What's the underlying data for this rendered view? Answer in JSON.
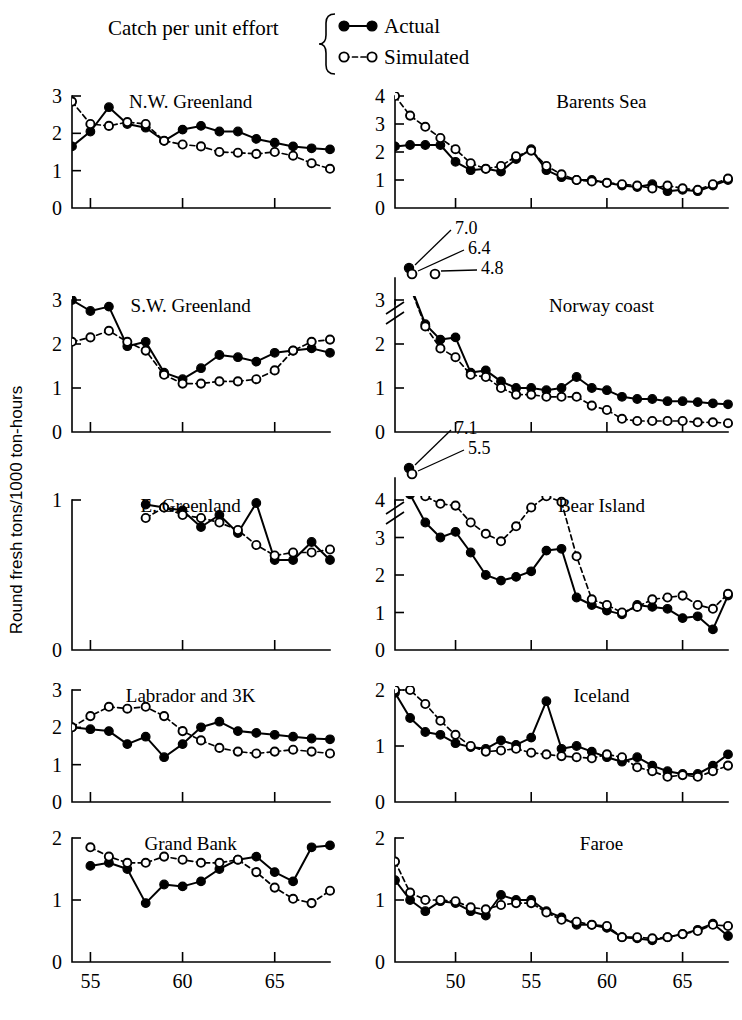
{
  "figure": {
    "ylabel": "Round fresh tons/1000 ton-hours",
    "legend_caption": "Catch per unit effort",
    "legend": [
      {
        "key": "actual",
        "label": "Actual"
      },
      {
        "key": "simulated",
        "label": "Simulated"
      }
    ]
  },
  "chart_data": {
    "type": "line",
    "title": "Catch per unit effort",
    "xlabel": "",
    "ylabel": "Round fresh tons/1000 ton-hours",
    "grid": false,
    "legend_position": "top-center",
    "series_styles": {
      "actual": {
        "marker": "filled-circle",
        "line": "solid"
      },
      "simulated": {
        "marker": "open-circle",
        "line": "dashed"
      }
    },
    "panels": [
      {
        "name": "N.W. Greenland",
        "column": "left",
        "xlim": [
          1954,
          1968
        ],
        "xticks": [
          55,
          60,
          65
        ],
        "ylim": [
          0,
          3
        ],
        "yticks": [
          0,
          1,
          2,
          3
        ],
        "axis_break": false,
        "offscale": [],
        "x": [
          1954,
          1955,
          1956,
          1957,
          1958,
          1959,
          1960,
          1961,
          1962,
          1963,
          1964,
          1965,
          1966,
          1967,
          1968
        ],
        "series": [
          {
            "name": "Actual",
            "key": "actual",
            "values": [
              1.65,
              2.05,
              2.7,
              2.25,
              2.15,
              1.8,
              2.1,
              2.2,
              2.05,
              2.05,
              1.85,
              1.75,
              1.65,
              1.6,
              1.57
            ]
          },
          {
            "name": "Simulated",
            "key": "simulated",
            "values": [
              2.85,
              2.25,
              2.2,
              2.3,
              2.25,
              1.8,
              1.7,
              1.65,
              1.5,
              1.48,
              1.45,
              1.5,
              1.4,
              1.2,
              1.05
            ]
          }
        ]
      },
      {
        "name": "Barents Sea",
        "column": "right",
        "xlim": [
          1946,
          1968
        ],
        "xticks": [
          50,
          55,
          60,
          65
        ],
        "ylim": [
          0,
          4
        ],
        "yticks": [
          0,
          1,
          2,
          3,
          4
        ],
        "axis_break": false,
        "offscale": [],
        "x": [
          1946,
          1947,
          1948,
          1949,
          1950,
          1951,
          1952,
          1953,
          1954,
          1955,
          1956,
          1957,
          1958,
          1959,
          1960,
          1961,
          1962,
          1963,
          1964,
          1965,
          1966,
          1967,
          1968
        ],
        "series": [
          {
            "name": "Actual",
            "key": "actual",
            "values": [
              2.2,
              2.25,
              2.25,
              2.25,
              1.65,
              1.35,
              1.4,
              1.3,
              1.75,
              2.1,
              1.35,
              1.1,
              1.0,
              1.0,
              0.9,
              0.8,
              0.75,
              0.85,
              0.6,
              0.65,
              0.6,
              0.8,
              1.0
            ]
          },
          {
            "name": "Simulated",
            "key": "simulated",
            "values": [
              4.0,
              3.3,
              2.9,
              2.5,
              2.1,
              1.6,
              1.4,
              1.5,
              1.85,
              2.05,
              1.5,
              1.2,
              1.0,
              0.95,
              0.9,
              0.85,
              0.8,
              0.7,
              0.8,
              0.7,
              0.65,
              0.85,
              1.05
            ]
          }
        ]
      },
      {
        "name": "S.W. Greenland",
        "column": "left",
        "xlim": [
          1954,
          1968
        ],
        "xticks": [
          55,
          60,
          65
        ],
        "ylim": [
          0,
          3
        ],
        "yticks": [
          0,
          1,
          2,
          3
        ],
        "axis_break": false,
        "offscale": [],
        "x": [
          1954,
          1955,
          1956,
          1957,
          1958,
          1959,
          1960,
          1961,
          1962,
          1963,
          1964,
          1965,
          1966,
          1967,
          1968
        ],
        "series": [
          {
            "name": "Actual",
            "key": "actual",
            "values": [
              3.0,
              2.75,
              2.85,
              1.95,
              2.05,
              1.35,
              1.2,
              1.45,
              1.75,
              1.7,
              1.6,
              1.8,
              1.85,
              1.9,
              1.8
            ]
          },
          {
            "name": "Simulated",
            "key": "simulated",
            "values": [
              2.05,
              2.15,
              2.3,
              2.05,
              1.85,
              1.3,
              1.1,
              1.1,
              1.15,
              1.15,
              1.2,
              1.4,
              1.85,
              2.05,
              2.1
            ]
          }
        ]
      },
      {
        "name": "Norway coast",
        "column": "right",
        "xlim": [
          1946,
          1968
        ],
        "xticks": [
          50,
          55,
          60,
          65
        ],
        "ylim": [
          0,
          3
        ],
        "yticks": [
          0,
          1,
          2,
          3
        ],
        "axis_break": true,
        "offscale": [
          {
            "label": "7.0",
            "series": "actual"
          },
          {
            "label": "6.4",
            "series": "simulated"
          },
          {
            "label": "4.8",
            "series": "simulated"
          }
        ],
        "x": [
          1947,
          1948,
          1949,
          1950,
          1951,
          1952,
          1953,
          1954,
          1955,
          1956,
          1957,
          1958,
          1959,
          1960,
          1961,
          1962,
          1963,
          1964,
          1965,
          1966,
          1967,
          1968
        ],
        "series": [
          {
            "name": "Actual",
            "key": "actual",
            "values": [
              3.35,
              2.45,
              2.1,
              2.15,
              1.35,
              1.4,
              1.15,
              1.0,
              1.0,
              0.95,
              1.0,
              1.25,
              1.0,
              0.95,
              0.8,
              0.75,
              0.75,
              0.7,
              0.7,
              0.68,
              0.65,
              0.63
            ]
          },
          {
            "name": "Simulated",
            "key": "simulated",
            "values": [
              3.3,
              2.4,
              1.9,
              1.7,
              1.3,
              1.25,
              1.0,
              0.85,
              0.85,
              0.8,
              0.8,
              0.8,
              0.6,
              0.5,
              0.3,
              0.25,
              0.25,
              0.25,
              0.25,
              0.22,
              0.22,
              0.2
            ]
          }
        ]
      },
      {
        "name": "E. Greenland",
        "column": "left",
        "xlim": [
          1954,
          1968
        ],
        "xticks": [
          55,
          60,
          65
        ],
        "ylim": [
          0,
          1
        ],
        "yticks": [
          0,
          1
        ],
        "axis_break": false,
        "offscale": [],
        "x": [
          1958,
          1959,
          1960,
          1961,
          1962,
          1963,
          1964,
          1965,
          1966,
          1967,
          1968
        ],
        "series": [
          {
            "name": "Actual",
            "key": "actual",
            "values": [
              0.97,
              0.95,
              0.93,
              0.82,
              0.9,
              0.78,
              0.98,
              0.6,
              0.6,
              0.72,
              0.6
            ]
          },
          {
            "name": "Simulated",
            "key": "simulated",
            "values": [
              0.88,
              0.95,
              0.9,
              0.88,
              0.85,
              0.8,
              0.7,
              0.63,
              0.65,
              0.65,
              0.67
            ]
          }
        ]
      },
      {
        "name": "Bear Island",
        "column": "right",
        "xlim": [
          1946,
          1968
        ],
        "xticks": [
          50,
          55,
          60,
          65
        ],
        "ylim": [
          0,
          4
        ],
        "yticks": [
          0,
          1,
          2,
          3,
          4
        ],
        "axis_break": true,
        "offscale": [
          {
            "label": "7.1",
            "series": "actual"
          },
          {
            "label": "5.5",
            "series": "simulated"
          }
        ],
        "x": [
          1947,
          1948,
          1949,
          1950,
          1951,
          1952,
          1953,
          1954,
          1955,
          1956,
          1957,
          1958,
          1959,
          1960,
          1961,
          1962,
          1963,
          1964,
          1965,
          1966,
          1967,
          1968
        ],
        "series": [
          {
            "name": "Actual",
            "key": "actual",
            "values": [
              4.15,
              3.4,
              3.0,
              3.15,
              2.6,
              2.0,
              1.85,
              1.95,
              2.1,
              2.65,
              2.7,
              1.4,
              1.2,
              1.05,
              0.95,
              1.2,
              1.15,
              1.1,
              0.85,
              0.9,
              0.55,
              1.45
            ]
          },
          {
            "name": "Simulated",
            "key": "simulated",
            "values": [
              4.2,
              4.1,
              3.9,
              3.85,
              3.4,
              3.1,
              2.9,
              3.3,
              3.8,
              4.1,
              3.95,
              2.5,
              1.35,
              1.2,
              1.0,
              1.15,
              1.35,
              1.4,
              1.45,
              1.2,
              1.1,
              1.5
            ]
          }
        ]
      },
      {
        "name": "Labrador and 3K",
        "column": "left",
        "xlim": [
          1954,
          1968
        ],
        "xticks": [
          55,
          60,
          65
        ],
        "ylim": [
          0,
          3
        ],
        "yticks": [
          0,
          1,
          2,
          3
        ],
        "axis_break": false,
        "offscale": [],
        "x": [
          1954,
          1955,
          1956,
          1957,
          1958,
          1959,
          1960,
          1961,
          1962,
          1963,
          1964,
          1965,
          1966,
          1967,
          1968
        ],
        "series": [
          {
            "name": "Actual",
            "key": "actual",
            "values": [
              2.0,
              1.95,
              1.9,
              1.55,
              1.75,
              1.2,
              1.55,
              2.0,
              2.15,
              1.9,
              1.85,
              1.8,
              1.75,
              1.7,
              1.68
            ]
          },
          {
            "name": "Simulated",
            "key": "simulated",
            "values": [
              2.0,
              2.3,
              2.55,
              2.5,
              2.55,
              2.3,
              1.9,
              1.65,
              1.45,
              1.35,
              1.3,
              1.35,
              1.4,
              1.35,
              1.3
            ]
          }
        ]
      },
      {
        "name": "Iceland",
        "column": "right",
        "xlim": [
          1946,
          1968
        ],
        "xticks": [
          50,
          55,
          60,
          65
        ],
        "ylim": [
          0,
          2
        ],
        "yticks": [
          0,
          1,
          2
        ],
        "axis_break": false,
        "offscale": [],
        "x": [
          1946,
          1947,
          1948,
          1949,
          1950,
          1951,
          1952,
          1953,
          1954,
          1955,
          1956,
          1957,
          1958,
          1959,
          1960,
          1961,
          1962,
          1963,
          1964,
          1965,
          1966,
          1967,
          1968
        ],
        "series": [
          {
            "name": "Actual",
            "key": "actual",
            "values": [
              1.95,
              1.5,
              1.25,
              1.2,
              1.05,
              0.98,
              0.95,
              1.1,
              1.02,
              1.15,
              1.8,
              0.95,
              1.0,
              0.9,
              0.8,
              0.72,
              0.8,
              0.65,
              0.55,
              0.5,
              0.5,
              0.65,
              0.85
            ]
          },
          {
            "name": "Simulated",
            "key": "simulated",
            "values": [
              2.0,
              2.0,
              1.75,
              1.45,
              1.2,
              1.0,
              0.9,
              0.92,
              0.95,
              0.88,
              0.85,
              0.82,
              0.8,
              0.78,
              0.85,
              0.8,
              0.62,
              0.55,
              0.45,
              0.48,
              0.45,
              0.55,
              0.65
            ]
          }
        ]
      },
      {
        "name": "Grand Bank",
        "column": "left",
        "xlim": [
          1954,
          1968
        ],
        "xticks": [
          55,
          60,
          65
        ],
        "ylim": [
          0,
          2
        ],
        "yticks": [
          0,
          1,
          2
        ],
        "axis_break": false,
        "offscale": [],
        "x": [
          1955,
          1956,
          1957,
          1958,
          1959,
          1960,
          1961,
          1962,
          1963,
          1964,
          1965,
          1966,
          1967,
          1968
        ],
        "series": [
          {
            "name": "Actual",
            "key": "actual",
            "values": [
              1.55,
              1.6,
              1.5,
              0.95,
              1.25,
              1.22,
              1.3,
              1.5,
              1.65,
              1.7,
              1.45,
              1.3,
              1.85,
              1.88
            ]
          },
          {
            "name": "Simulated",
            "key": "simulated",
            "values": [
              1.85,
              1.7,
              1.6,
              1.6,
              1.7,
              1.65,
              1.6,
              1.6,
              1.65,
              1.45,
              1.2,
              1.02,
              0.95,
              1.15
            ]
          }
        ]
      },
      {
        "name": "Faroe",
        "column": "right",
        "xlim": [
          1946,
          1968
        ],
        "xticks": [
          50,
          55,
          60,
          65
        ],
        "ylim": [
          0,
          2
        ],
        "yticks": [
          0,
          1,
          2
        ],
        "axis_break": false,
        "offscale": [],
        "x": [
          1946,
          1947,
          1948,
          1949,
          1950,
          1951,
          1952,
          1953,
          1954,
          1955,
          1956,
          1957,
          1958,
          1959,
          1960,
          1961,
          1962,
          1963,
          1964,
          1965,
          1966,
          1967,
          1968
        ],
        "series": [
          {
            "name": "Actual",
            "key": "actual",
            "values": [
              1.32,
              1.0,
              0.82,
              0.98,
              0.95,
              0.82,
              0.75,
              1.08,
              1.0,
              1.0,
              0.82,
              0.72,
              0.6,
              0.6,
              0.55,
              0.4,
              0.38,
              0.35,
              0.4,
              0.45,
              0.52,
              0.62,
              0.42
            ]
          },
          {
            "name": "Simulated",
            "key": "simulated",
            "values": [
              1.62,
              1.12,
              1.0,
              1.0,
              0.98,
              0.88,
              0.85,
              0.92,
              0.95,
              0.95,
              0.8,
              0.68,
              0.65,
              0.6,
              0.58,
              0.4,
              0.4,
              0.38,
              0.4,
              0.45,
              0.5,
              0.6,
              0.58
            ]
          }
        ]
      }
    ]
  }
}
